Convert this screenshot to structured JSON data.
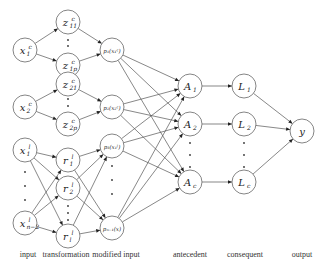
{
  "diagram": {
    "type": "neuro-fuzzy network",
    "nodes": {
      "input_c": [
        {
          "id": "x1c",
          "label": "x",
          "sub": "1",
          "sup": "c",
          "cx": 25,
          "cy": 50
        },
        {
          "id": "x2c",
          "label": "x",
          "sub": "2",
          "sup": "c",
          "cx": 25,
          "cy": 107
        }
      ],
      "input_l": [
        {
          "id": "x1l",
          "label": "x",
          "sub": "1",
          "sup": "l",
          "cx": 25,
          "cy": 150
        },
        {
          "id": "xn2l",
          "label": "x",
          "sub": "n−2",
          "sup": "l",
          "cx": 25,
          "cy": 223
        }
      ],
      "transformation": [
        {
          "id": "z11",
          "label": "z",
          "sub": "11",
          "sup": "c",
          "cx": 68,
          "cy": 22
        },
        {
          "id": "z1p",
          "label": "z",
          "sub": "1p",
          "sup": "c",
          "cx": 68,
          "cy": 65
        },
        {
          "id": "z21",
          "label": "z",
          "sub": "21",
          "sup": "c",
          "cx": 68,
          "cy": 84
        },
        {
          "id": "z2p",
          "label": "z",
          "sub": "2p",
          "sup": "c",
          "cx": 68,
          "cy": 124
        },
        {
          "id": "r1",
          "label": "r",
          "sub": "1",
          "sup": "l",
          "cx": 68,
          "cy": 160
        },
        {
          "id": "r2",
          "label": "r",
          "sub": "2",
          "sup": "l",
          "cx": 68,
          "cy": 188
        },
        {
          "id": "rl",
          "label": "r",
          "sub": "l",
          "sup": "l",
          "cx": 68,
          "cy": 236
        }
      ],
      "modified_input": [
        {
          "id": "p1",
          "label": "p₁(x₁ᶜ)",
          "cx": 112,
          "cy": 50
        },
        {
          "id": "p2",
          "label": "p₂(x₂ᶜ)",
          "cx": 112,
          "cy": 107
        },
        {
          "id": "p3",
          "label": "p₃(x₁ˡ)",
          "cx": 112,
          "cy": 146
        },
        {
          "id": "pn1",
          "label": "pₙ₋₁(x)",
          "cx": 112,
          "cy": 228
        }
      ],
      "antecedent": [
        {
          "id": "A1",
          "label": "A",
          "sub": "1",
          "cx": 190,
          "cy": 86
        },
        {
          "id": "A2",
          "label": "A",
          "sub": "2",
          "cx": 190,
          "cy": 124
        },
        {
          "id": "Ac",
          "label": "A",
          "sub": "c",
          "cx": 190,
          "cy": 182
        }
      ],
      "consequent": [
        {
          "id": "L1",
          "label": "L",
          "sub": "1",
          "cx": 244,
          "cy": 86
        },
        {
          "id": "L2",
          "label": "L",
          "sub": "2",
          "cx": 244,
          "cy": 124
        },
        {
          "id": "Lc",
          "label": "L",
          "sub": "c",
          "cx": 244,
          "cy": 182
        }
      ],
      "output": [
        {
          "id": "y",
          "label": "y",
          "cx": 302,
          "cy": 131
        }
      ]
    },
    "layer_labels": {
      "input": "input",
      "transformation": "transformation",
      "modified_input": "modified input",
      "antecedent": "antecedent",
      "consequent": "consequent",
      "output": "output"
    }
  }
}
